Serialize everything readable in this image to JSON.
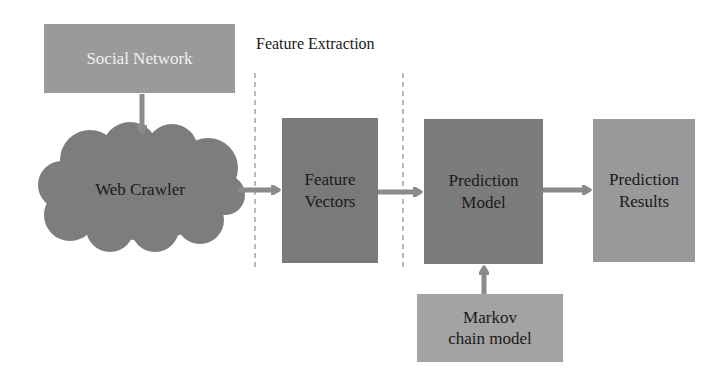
{
  "diagram": {
    "section_label": "Feature Extraction",
    "nodes": {
      "social_network": {
        "label": "Social Network",
        "fill": "#9a9a9a",
        "text_color": "#f0f0f0"
      },
      "web_crawler": {
        "label": "Web Crawler",
        "shape": "cloud",
        "fill": "#7d7d7d",
        "text_color": "#1a1a1a"
      },
      "feature_vectors": {
        "line1": "Feature",
        "line2": "Vectors",
        "fill": "#7a7a7a",
        "text_color": "#1a1a1a"
      },
      "prediction_model": {
        "line1": "Prediction",
        "line2": "Model",
        "fill": "#7c7c7c",
        "text_color": "#1a1a1a"
      },
      "prediction_results": {
        "line1": "Prediction",
        "line2": "Results",
        "fill": "#999999",
        "text_color": "#1a1a1a"
      },
      "markov": {
        "line1": "Markov",
        "line2": "chain model",
        "fill": "#a3a3a3",
        "text_color": "#1a1a1a"
      }
    },
    "edges": [
      {
        "from": "Social Network",
        "to": "Web Crawler"
      },
      {
        "from": "Web Crawler",
        "to": "Feature Vectors"
      },
      {
        "from": "Feature Vectors",
        "to": "Prediction Model"
      },
      {
        "from": "Prediction Model",
        "to": "Prediction Results"
      },
      {
        "from": "Markov chain model",
        "to": "Prediction Model"
      }
    ],
    "colors": {
      "arrow": "#8a8a8a",
      "dashed_line": "#8c8c8c"
    }
  }
}
